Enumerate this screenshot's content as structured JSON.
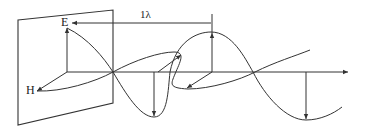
{
  "diagram": {
    "labels": {
      "electric_field": "E",
      "magnetic_field": "H",
      "wavelength": "1λ"
    },
    "colors": {
      "stroke": "#333333",
      "background": "#ffffff"
    }
  }
}
